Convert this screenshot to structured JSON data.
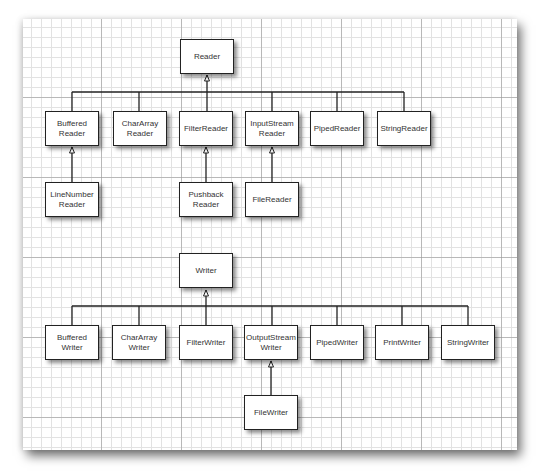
{
  "reader_hierarchy": {
    "root": {
      "label": "Reader"
    },
    "children": [
      {
        "label": "Buffered\nReader",
        "subclasses": [
          {
            "label": "LineNumber\nReader"
          }
        ]
      },
      {
        "label": "CharArray\nReader",
        "subclasses": []
      },
      {
        "label": "FilterReader",
        "subclasses": [
          {
            "label": "Pushback\nReader"
          }
        ]
      },
      {
        "label": "InputStream\nReader",
        "subclasses": [
          {
            "label": "FileReader"
          }
        ]
      },
      {
        "label": "PipedReader",
        "subclasses": []
      },
      {
        "label": "StringReader",
        "subclasses": []
      }
    ]
  },
  "writer_hierarchy": {
    "root": {
      "label": "Writer"
    },
    "children": [
      {
        "label": "Buffered\nWriter",
        "subclasses": []
      },
      {
        "label": "CharArray\nWriter",
        "subclasses": []
      },
      {
        "label": "FilterWriter",
        "subclasses": []
      },
      {
        "label": "OutputStream\nWriter",
        "subclasses": [
          {
            "label": "FileWriter"
          }
        ]
      },
      {
        "label": "PipedWriter",
        "subclasses": []
      },
      {
        "label": "PrintWriter",
        "subclasses": []
      },
      {
        "label": "StringWriter",
        "subclasses": []
      }
    ]
  },
  "colors": {
    "box_border": "#222222",
    "line": "#222222",
    "grid_minor": "#e2e2e2",
    "text": "#333333"
  }
}
